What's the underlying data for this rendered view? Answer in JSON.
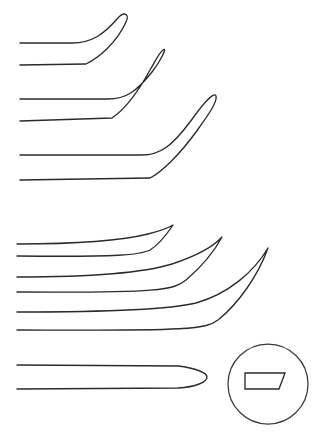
{
  "figure": {
    "background_color": "#ffffff",
    "line_color": "#2b2b2b",
    "detail_circle_color": "#3a3a3a",
    "canvas": {
      "width": 312,
      "height": 438
    }
  },
  "groups": [
    {
      "name": "upper-group",
      "label": "Upper group - blunt rounded angled tips",
      "instrument_count": 3
    },
    {
      "name": "lower-group",
      "label": "Lower group - sharp pointed angled tips",
      "instrument_count": 3
    },
    {
      "name": "bottom-group",
      "label": "Bottom - straight instrument with rounded spatulate tip",
      "instrument_count": 1
    }
  ],
  "instruments": [
    {
      "id": "instrument-1",
      "group": "upper-group",
      "label": "Angled blunt elevator, short",
      "tip_style": "rounded-loop",
      "shaft_start_x": 20,
      "shaft_top_y": 43,
      "shaft_bottom_y": 65,
      "bend_x": 78,
      "tip_x": 122,
      "tip_y": 14,
      "path": "M 20 43 L 72 43 C 92 43 104 34 118 18 C 124 11 130 14 126 22 C 116 44 98 58 86 64 L 20 65"
    },
    {
      "id": "instrument-2",
      "group": "upper-group",
      "label": "Angled blunt elevator, medium",
      "tip_style": "rounded-loop",
      "shaft_start_x": 20,
      "shaft_top_y": 99,
      "shaft_bottom_y": 121,
      "bend_x": 112,
      "tip_x": 167,
      "tip_y": 50,
      "path": "M 20 99 L 108 99 C 126 99 136 92 152 72 C 160 62 168 46 163 50 C 159 53 157 58 150 70 C 138 92 124 110 112 118 L 20 121"
    },
    {
      "id": "instrument-3",
      "group": "upper-group",
      "label": "Angled blunt elevator, long",
      "tip_style": "rounded-loop",
      "shaft_start_x": 20,
      "shaft_top_y": 155,
      "shaft_bottom_y": 180,
      "bend_x": 146,
      "tip_x": 216,
      "tip_y": 95,
      "path": "M 20 155 L 142 155 C 160 155 172 146 190 122 C 200 108 214 90 216 96 C 218 102 206 118 196 132 C 180 154 162 172 150 178 L 20 180"
    },
    {
      "id": "instrument-4",
      "group": "lower-group",
      "label": "Angled sharp dissector, short",
      "tip_style": "sharp-point",
      "shaft_start_x": 17,
      "shaft_top_y": 244,
      "shaft_bottom_y": 256,
      "bend_x": 140,
      "tip_x": 173,
      "tip_y": 225,
      "path": "M 17 244 C 70 244 120 241 148 234 C 160 231 168 228 173 225 C 167 234 160 244 150 250 C 140 255 120 257 17 256"
    },
    {
      "id": "instrument-5",
      "group": "lower-group",
      "label": "Angled sharp dissector, medium",
      "tip_style": "sharp-point",
      "shaft_start_x": 17,
      "shaft_top_y": 277,
      "shaft_bottom_y": 292,
      "bend_x": 168,
      "tip_x": 222,
      "tip_y": 237,
      "path": "M 17 277 C 80 277 140 274 172 264 C 196 256 214 246 222 237 C 214 252 200 268 186 280 C 174 290 160 293 17 292"
    },
    {
      "id": "instrument-6",
      "group": "lower-group",
      "label": "Angled sharp dissector, long",
      "tip_style": "sharp-point",
      "shaft_start_x": 17,
      "shaft_top_y": 312,
      "shaft_bottom_y": 330,
      "bend_x": 196,
      "tip_x": 268,
      "tip_y": 248,
      "path": "M 17 312 C 90 312 168 310 196 303 C 228 294 254 272 268 248 C 258 276 238 304 218 320 C 206 329 192 331 17 330"
    },
    {
      "id": "instrument-7",
      "group": "bottom-group",
      "label": "Straight instrument with rounded spatulate tip",
      "tip_style": "rounded-spatulate",
      "shaft_start_x": 17,
      "shaft_top_y": 365,
      "shaft_bottom_y": 389,
      "tip_x": 207,
      "path": "M 17 365 L 178 366 C 196 368 207 373 207 377 C 207 382 196 387 178 388 L 17 389"
    }
  ],
  "detail_inset": {
    "id": "cross-section-detail",
    "label": "Cross-section detail",
    "circle": {
      "cx": 268,
      "cy": 384,
      "r": 40
    },
    "section_label": "Flat blade profile with beveled end",
    "section_path": "M 245 373 L 285 373 L 279 389 L 245 389 Z"
  }
}
